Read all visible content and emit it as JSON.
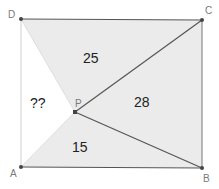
{
  "diagram": {
    "type": "geometry-rectangle-interior-point",
    "colors": {
      "shade": "#ebebeb",
      "edge": "#555555",
      "point": "#444444",
      "vertex_label": "#7a7a7a",
      "area_label": "#222222",
      "background": "#ffffff"
    },
    "vertices": {
      "A": {
        "label": "A",
        "x": 21,
        "y": 167
      },
      "B": {
        "label": "B",
        "x": 202,
        "y": 168
      },
      "C": {
        "label": "C",
        "x": 202,
        "y": 20
      },
      "D": {
        "label": "D",
        "x": 21,
        "y": 19
      },
      "P": {
        "label": "P",
        "x": 75,
        "y": 112
      }
    },
    "regions": [
      {
        "name": "triangle-DPC",
        "area_label": "25",
        "shaded": true
      },
      {
        "name": "triangle-PCB",
        "area_label": "28",
        "shaded": true
      },
      {
        "name": "triangle-APB",
        "area_label": "15",
        "shaded": true
      },
      {
        "name": "triangle-APD",
        "area_label": "??",
        "shaded": false
      }
    ]
  }
}
